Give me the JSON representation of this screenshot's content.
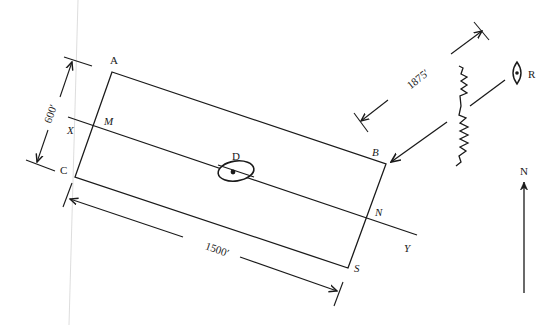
{
  "diagram": {
    "type": "site-plan",
    "corners": {
      "A": "A",
      "B": "B",
      "C": "C",
      "S": "S"
    },
    "section_line": {
      "start_label": "X",
      "end_label": "Y",
      "left_intersection": "M",
      "right_intersection": "N"
    },
    "wells": {
      "inside": "D",
      "outside": "R"
    },
    "dimensions": {
      "width": "600′",
      "length": "1500′",
      "distance_to_ridge": "1875′"
    },
    "north_arrow": {
      "label": "N"
    }
  }
}
